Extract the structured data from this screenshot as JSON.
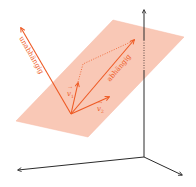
{
  "diagram": {
    "colors": {
      "plane_fill": "#f9c3af",
      "plane_stroke": "#f6b39c",
      "vector": "#ee5a24",
      "axis": "#2b2b2b",
      "background": "#ffffff"
    },
    "labels": {
      "independent": "unabhängig",
      "dependent": "abhängig",
      "v1": "v",
      "v1_sub": "1",
      "v2": "v",
      "v2_sub": "2"
    }
  }
}
